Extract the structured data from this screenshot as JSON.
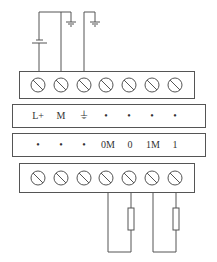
{
  "diagram": {
    "title": "",
    "top_terminal_count": 7,
    "bottom_terminal_count": 7,
    "row1_labels": [
      "L+",
      "M",
      "⏚",
      "•",
      "•",
      "•",
      "•"
    ],
    "row2_labels": [
      "•",
      "•",
      "•",
      "0M",
      "0",
      "1M",
      "1"
    ],
    "components": {
      "power_supply": "battery-icon",
      "grounds": [
        "ground-icon",
        "ground-icon"
      ],
      "loads": [
        "resistor-icon",
        "resistor-icon"
      ]
    },
    "colors": {
      "line": "#555555",
      "text": "#333333"
    }
  }
}
